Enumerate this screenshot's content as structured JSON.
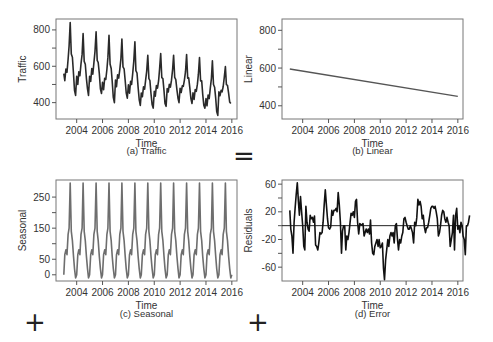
{
  "operators": {
    "equals": "=",
    "plus_1": "+",
    "plus_2": "+"
  },
  "chart_data": [
    {
      "id": "traffic",
      "type": "line",
      "caption": "(a) Traffic",
      "xlabel": "Time",
      "ylabel": "Traffic",
      "xlim": [
        2002.4,
        2016.4
      ],
      "ylim": [
        310,
        860
      ],
      "xticks": [
        2004,
        2006,
        2008,
        2010,
        2012,
        2014,
        2016
      ],
      "yticks": [
        400,
        500,
        600,
        700,
        800
      ],
      "ytick_labels": [
        "400",
        "",
        "600",
        "",
        "800"
      ],
      "line_color": "#2a2a2a",
      "line_width": 1.6,
      "series_description": "Monthly traffic 2003-2016, strong annual seasonality with peaks mid-year, declining trend",
      "peaks": [
        [
          2003.6,
          840
        ],
        [
          2004.6,
          780
        ],
        [
          2005.6,
          790
        ],
        [
          2006.6,
          770
        ],
        [
          2007.6,
          750
        ],
        [
          2008.6,
          735
        ],
        [
          2009.6,
          660
        ],
        [
          2010.6,
          670
        ],
        [
          2011.6,
          660
        ],
        [
          2012.6,
          665
        ],
        [
          2013.6,
          648
        ],
        [
          2014.6,
          630
        ],
        [
          2015.6,
          598
        ]
      ],
      "troughs": [
        [
          2003.9,
          440
        ],
        [
          2004.9,
          440
        ],
        [
          2005.9,
          450
        ],
        [
          2006.9,
          400
        ],
        [
          2007.9,
          425
        ],
        [
          2008.9,
          385
        ],
        [
          2009.9,
          370
        ],
        [
          2010.9,
          380
        ],
        [
          2011.9,
          400
        ],
        [
          2012.9,
          395
        ],
        [
          2013.9,
          370
        ],
        [
          2014.9,
          330
        ],
        [
          2015.95,
          395
        ]
      ]
    },
    {
      "id": "linear",
      "type": "line",
      "caption": "(b) Linear",
      "xlabel": "Time",
      "ylabel": "Linear",
      "xlim": [
        2002.4,
        2016.4
      ],
      "ylim": [
        330,
        860
      ],
      "xticks": [
        2004,
        2006,
        2008,
        2010,
        2012,
        2014,
        2016
      ],
      "yticks": [
        400,
        500,
        600,
        700,
        800
      ],
      "ytick_labels": [
        "400",
        "",
        "600",
        "",
        "800"
      ],
      "line_color": "#555555",
      "line_width": 1.4,
      "x": [
        2003.0,
        2016.0
      ],
      "y": [
        595,
        450
      ]
    },
    {
      "id": "seasonal",
      "type": "line",
      "caption": "(c) Seasonal",
      "xlabel": "Time",
      "ylabel": "Seasonal",
      "xlim": [
        2002.4,
        2016.4
      ],
      "ylim": [
        -20,
        305
      ],
      "xticks": [
        2004,
        2006,
        2008,
        2010,
        2012,
        2014,
        2016
      ],
      "yticks": [
        0,
        50,
        100,
        150,
        200,
        250
      ],
      "ytick_labels": [
        "0",
        "50",
        "",
        "150",
        "",
        "250"
      ],
      "line_color": "#6e6e6e",
      "line_width": 1.6,
      "cycle_pattern": [
        0,
        65,
        80,
        65,
        130,
        150,
        295,
        140,
        110,
        60,
        20,
        -10
      ],
      "start_year": 2003.0,
      "end_year": 2016.0
    },
    {
      "id": "error",
      "type": "line",
      "caption": "(d) Error",
      "xlabel": "Time",
      "ylabel": "Residuals",
      "xlim": [
        2002.4,
        2016.4
      ],
      "ylim": [
        -80,
        66
      ],
      "xticks": [
        2004,
        2006,
        2008,
        2010,
        2012,
        2014,
        2016
      ],
      "yticks": [
        -60,
        -40,
        -20,
        0,
        20,
        40,
        60
      ],
      "ytick_labels": [
        "-60",
        "",
        "-20",
        "",
        "20",
        "",
        "60"
      ],
      "zero_line": true,
      "line_color": "#111111",
      "line_width": 1.6,
      "x_start": 2003.0,
      "x_step": 0.0833,
      "values": [
        22,
        -5,
        -15,
        -40,
        5,
        25,
        45,
        62,
        35,
        15,
        42,
        20,
        0,
        -30,
        -35,
        28,
        5,
        -5,
        -8,
        15,
        10,
        12,
        5,
        14,
        -28,
        -30,
        -35,
        -25,
        -10,
        -12,
        -10,
        5,
        30,
        52,
        30,
        10,
        -3,
        -5,
        -2,
        22,
        15,
        22,
        22,
        25,
        20,
        48,
        30,
        5,
        -40,
        -8,
        0,
        0,
        -35,
        -15,
        -20,
        -10,
        5,
        18,
        15,
        20,
        12,
        35,
        38,
        5,
        -12,
        3,
        2,
        1,
        3,
        -15,
        -10,
        -5,
        -10,
        -5,
        -12,
        8,
        -25,
        -40,
        -42,
        -30,
        -25,
        -20,
        -30,
        -20,
        -32,
        -30,
        -25,
        -62,
        -78,
        -50,
        -35,
        -20,
        -30,
        -15,
        -10,
        -15,
        -10,
        -25,
        0,
        3,
        -20,
        -35,
        -20,
        -25,
        -15,
        -10,
        10,
        12,
        5,
        0,
        -5,
        -5,
        0,
        -5,
        -10,
        -25,
        5,
        0,
        12,
        38,
        30,
        35,
        28,
        10,
        15,
        -2,
        -10,
        -3,
        -3,
        5,
        15,
        25,
        28,
        28,
        25,
        28,
        20,
        10,
        -15,
        -10,
        0,
        15,
        22,
        20,
        10,
        5,
        12,
        5,
        0,
        -30,
        -20,
        -10,
        15,
        -35,
        15,
        25,
        -5,
        0,
        -10,
        5,
        0,
        -15,
        -20,
        -42,
        0,
        0,
        5,
        15
      ]
    }
  ]
}
